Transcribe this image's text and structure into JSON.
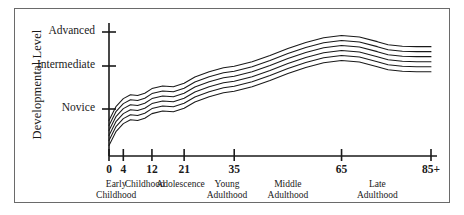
{
  "figure": {
    "name": "developmental-level-lifespan-chart",
    "background": "#ffffff",
    "frame_color": "#6a6a6a",
    "line_color": "#1a1a1a"
  },
  "chart_data": {
    "type": "line",
    "title": "",
    "xlabel": "",
    "ylabel": "Developmental Level",
    "grid": false,
    "legend_position": "none",
    "xlim": [
      0,
      90
    ],
    "ylim": [
      0,
      3
    ],
    "x_tick_labels": [
      "0",
      "4",
      "12",
      "21",
      "35",
      "65",
      "85+"
    ],
    "x_tick_values": [
      0,
      4,
      12,
      21,
      35,
      65,
      90
    ],
    "y_tick_labels": [
      "Novice",
      "Intermediate",
      "Advanced"
    ],
    "y_tick_values": [
      1,
      2,
      3
    ],
    "era_labels": [
      {
        "lines": [
          "Early",
          "Childhood"
        ],
        "center_x": 2
      },
      {
        "lines": [
          "Childhood"
        ],
        "center_x": 10
      },
      {
        "lines": [
          "Adolescence"
        ],
        "center_x": 20
      },
      {
        "lines": [
          "Young",
          "Adulthood"
        ],
        "center_x": 33
      },
      {
        "lines": [
          "Middle",
          "Adulthood"
        ],
        "center_x": 50
      },
      {
        "lines": [
          "Late",
          "Adulthood"
        ],
        "center_x": 75
      }
    ],
    "series": [
      {
        "name": "band-line-1",
        "offset": 0.0
      },
      {
        "name": "band-line-2",
        "offset": 0.13
      },
      {
        "name": "band-line-3",
        "offset": 0.26
      },
      {
        "name": "band-line-4",
        "offset": 0.39
      },
      {
        "name": "band-line-5",
        "offset": 0.52
      },
      {
        "name": "band-line-6",
        "offset": 0.65
      }
    ],
    "x": [
      0,
      2,
      4,
      6,
      8,
      10,
      12,
      15,
      18,
      21,
      24,
      28,
      32,
      35,
      40,
      45,
      50,
      55,
      60,
      65,
      70,
      75,
      78,
      82,
      86,
      90
    ],
    "values": [
      0.05,
      0.42,
      0.62,
      0.72,
      0.7,
      0.76,
      0.88,
      0.95,
      0.93,
      1.02,
      1.18,
      1.32,
      1.42,
      1.46,
      1.58,
      1.74,
      1.92,
      2.08,
      2.2,
      2.26,
      2.22,
      2.1,
      2.02,
      1.98,
      1.97,
      1.97
    ]
  }
}
